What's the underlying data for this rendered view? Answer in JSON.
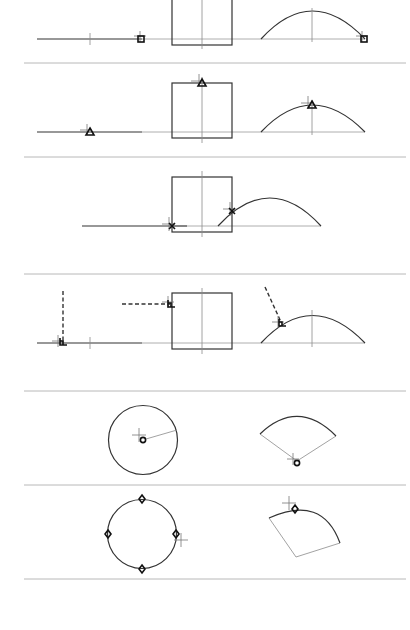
{
  "figure": {
    "panels": [
      {
        "id": "endpoint",
        "snap_marker": "square",
        "description": "Endpoint snap on line, rectangle and arc"
      },
      {
        "id": "midpoint",
        "snap_marker": "triangle",
        "description": "Midpoint snap on line, rectangle edge and arc"
      },
      {
        "id": "intersection",
        "snap_marker": "x",
        "description": "Intersection snap between line, rectangle and arc"
      },
      {
        "id": "perpendicular",
        "snap_marker": "perpendicular",
        "description": "Perpendicular snap from dashed lines to line, rectangle and arc"
      },
      {
        "id": "center",
        "snap_marker": "circle",
        "description": "Center snap on circle and arc sector"
      },
      {
        "id": "quadrant",
        "snap_marker": "diamond",
        "description": "Quadrant snap on circle and arc sector"
      }
    ],
    "colors": {
      "background": "#ffffff",
      "geometry": "#333333",
      "separator": "#b8b8b8",
      "marker": "#111111"
    }
  }
}
